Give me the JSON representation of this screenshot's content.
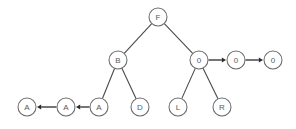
{
  "diagram": {
    "kind": "binary-tree-with-sibling-links",
    "canvas": {
      "width": 296,
      "height": 129,
      "background": "#ffffff"
    },
    "style": {
      "node_radius": 9,
      "node_fill": "#ffffff",
      "node_stroke": "#6b6b6b",
      "label_color": "#5a5a5a",
      "edge_color": "#4a4a4a",
      "arrow_color": "#2b2b2b"
    },
    "nodes": [
      {
        "id": "n-f",
        "label": "F",
        "x": 158,
        "y": 17,
        "name": "node-f"
      },
      {
        "id": "n-b",
        "label": "B",
        "x": 118,
        "y": 60,
        "name": "node-b"
      },
      {
        "id": "n-o1",
        "label": "0",
        "x": 199,
        "y": 60,
        "name": "node-o-1"
      },
      {
        "id": "n-o2",
        "label": "0",
        "x": 236,
        "y": 60,
        "name": "node-o-2"
      },
      {
        "id": "n-o3",
        "label": "0",
        "x": 273,
        "y": 60,
        "name": "node-o-3"
      },
      {
        "id": "n-a1",
        "label": "A",
        "x": 27,
        "y": 107,
        "name": "node-a-1"
      },
      {
        "id": "n-a2",
        "label": "A",
        "x": 66,
        "y": 107,
        "name": "node-a-2"
      },
      {
        "id": "n-a3",
        "label": "A",
        "x": 99,
        "y": 107,
        "name": "node-a-3"
      },
      {
        "id": "n-d",
        "label": "D",
        "x": 140,
        "y": 107,
        "name": "node-d"
      },
      {
        "id": "n-l",
        "label": "L",
        "x": 178,
        "y": 107,
        "name": "node-l"
      },
      {
        "id": "n-r",
        "label": "R",
        "x": 222,
        "y": 107,
        "name": "node-r"
      }
    ],
    "edges": [
      {
        "from": "n-f",
        "to": "n-b",
        "kind": "plain",
        "name": "edge-f-to-b"
      },
      {
        "from": "n-f",
        "to": "n-o1",
        "kind": "plain",
        "name": "edge-f-to-o1"
      },
      {
        "from": "n-b",
        "to": "n-a3",
        "kind": "plain",
        "name": "edge-b-to-a3"
      },
      {
        "from": "n-b",
        "to": "n-d",
        "kind": "plain",
        "name": "edge-b-to-d"
      },
      {
        "from": "n-o1",
        "to": "n-l",
        "kind": "plain",
        "name": "edge-o1-to-l"
      },
      {
        "from": "n-o1",
        "to": "n-r",
        "kind": "plain",
        "name": "edge-o1-to-r"
      },
      {
        "from": "n-o1",
        "to": "n-o2",
        "kind": "arrow",
        "name": "arrow-o1-to-o2"
      },
      {
        "from": "n-o2",
        "to": "n-o3",
        "kind": "arrow",
        "name": "arrow-o2-to-o3"
      },
      {
        "from": "n-a3",
        "to": "n-a2",
        "kind": "arrow",
        "name": "arrow-a3-to-a2"
      },
      {
        "from": "n-a2",
        "to": "n-a1",
        "kind": "arrow",
        "name": "arrow-a2-to-a1"
      }
    ]
  }
}
